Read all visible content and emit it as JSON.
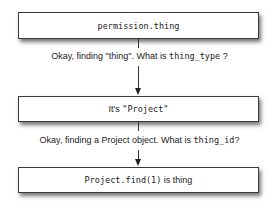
{
  "diagram": {
    "steps": [
      {
        "code": "permission.thing"
      },
      {
        "prefix": "It's ",
        "code": "\"Project\""
      },
      {
        "code": "Project.find(1)",
        "suffix": " is thing"
      }
    ],
    "transitions": [
      {
        "text": "Okay, finding \"thing\". What is ",
        "code": "thing_type",
        "suffix": " ?"
      },
      {
        "text": "Okay, finding a Project object. What is ",
        "code": "thing_id",
        "suffix": "?"
      }
    ]
  }
}
